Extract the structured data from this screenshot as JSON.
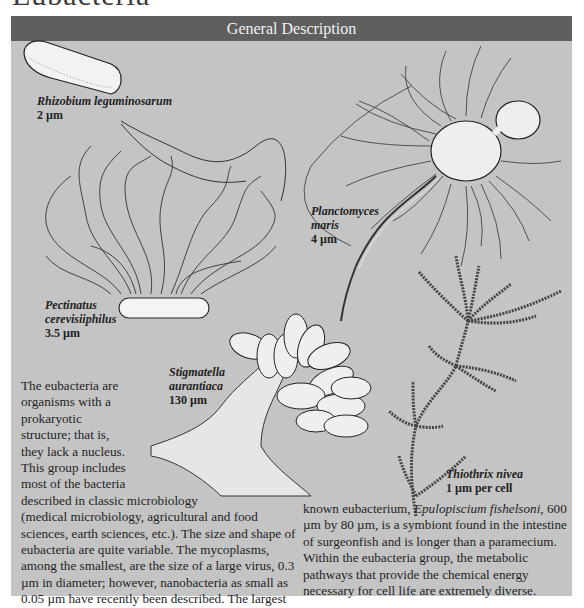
{
  "page": {
    "title": "Eubacteria"
  },
  "panel": {
    "header": "General Description",
    "colors": {
      "header_bg": "#5f5f5f",
      "panel_bg": "#c4c4c4",
      "header_text": "#f2f2f2"
    }
  },
  "organisms": [
    {
      "name": "Rhizobium leguminosarum",
      "size": "2 µm"
    },
    {
      "name": "Planctomyces maris",
      "name_line1": "Planctomyces",
      "name_line2": "maris",
      "size": "4 µm"
    },
    {
      "name": "Pectinatus cerevisiiphilus",
      "name_line1": "Pectinatus",
      "name_line2": "cerevisiiphilus",
      "size": "3.5 µm"
    },
    {
      "name": "Stigmatella aurantiaca",
      "name_line1": "Stigmatella",
      "name_line2": "aurantiaca",
      "size": "130 µm"
    },
    {
      "name": "Thiothrix nivea",
      "size": "1 µm per cell"
    }
  ],
  "description": {
    "lines_left": [
      "The eubacteria are",
      "organisms with a",
      "prokaryotic",
      "structure; that is,",
      "they lack a nucleus.",
      "This group includes",
      "most of the bacteria",
      "described in classic microbiology",
      "(medical microbiology, agricultural and food",
      "sciences, earth sciences, etc.). The size and shape of",
      "eubacteria are quite variable. The mycoplasms,",
      "among the smallest, are the size of a large virus, 0.3",
      "µm in diameter; however, nanobacteria as small as",
      "0.05 µm have recently been described. The largest"
    ],
    "right_line1_prefix": "known eubacterium, ",
    "right_line1_italic": "Epulopiscium fishelsoni",
    "right_line1_suffix": ", 600",
    "lines_right": [
      "µm by 80 µm, is a symbiont found in the intestine",
      "of surgeonfish and is longer than a paramecium.",
      "Within the eubacteria group, the metabolic",
      "pathways that provide the chemical energy",
      "necessary for cell life are extremely diverse."
    ]
  }
}
